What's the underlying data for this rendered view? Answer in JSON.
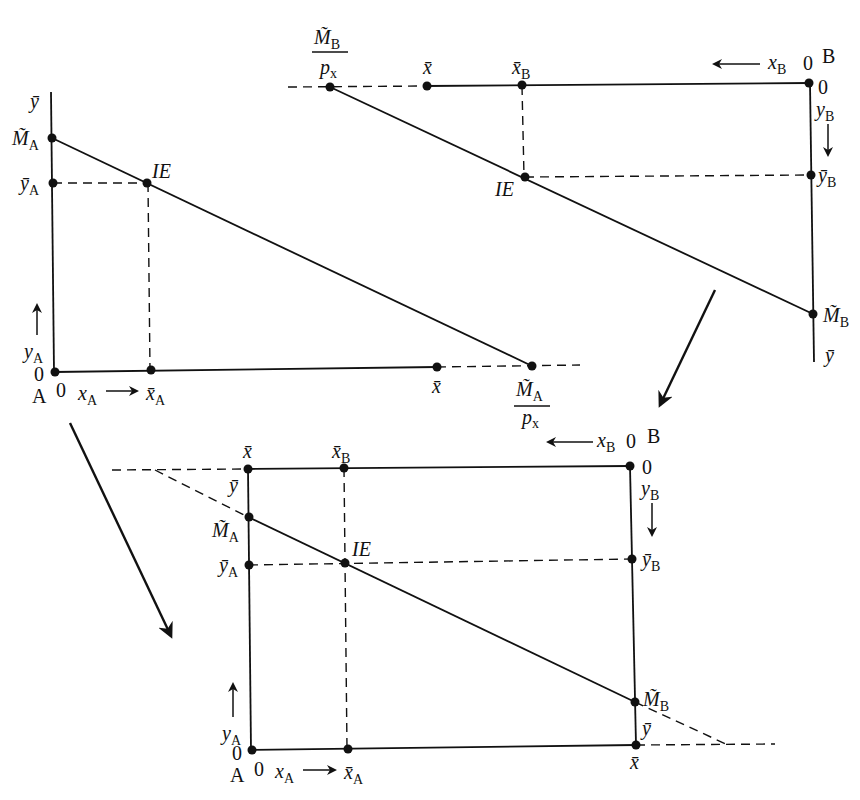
{
  "diagram": {
    "type": "edgeworth-box-construction",
    "panels": [
      {
        "id": "panel-A",
        "position": "top-left",
        "origin_label": "A",
        "origin_x_zero": "0",
        "origin_y_zero": "0",
        "x_axis_label": "x",
        "x_axis_sub": "A",
        "y_axis_label": "y",
        "y_axis_sub": "A",
        "y_top_label": "ȳ",
        "intercept_label": "M̃",
        "intercept_sub": "A",
        "endowment_y_label": "ȳ",
        "endowment_y_sub": "A",
        "endowment_x_label": "x̄",
        "endowment_x_sub": "A",
        "xbar_label": "x̄",
        "budget_x_intercept_num": "M̃",
        "budget_x_intercept_num_sub": "A",
        "budget_x_intercept_den": "p",
        "budget_x_intercept_den_sub": "x",
        "point_label": "IE"
      },
      {
        "id": "panel-B",
        "position": "top-right",
        "origin_label": "B",
        "origin_x_zero": "0",
        "origin_y_zero": "0",
        "x_axis_label": "x",
        "x_axis_sub": "B",
        "y_axis_label": "y",
        "y_axis_sub": "B",
        "y_bottom_label": "ȳ",
        "intercept_label": "M̃",
        "intercept_sub": "B",
        "endowment_y_label": "ȳ",
        "endowment_y_sub": "B",
        "endowment_x_label": "x̄",
        "endowment_x_sub": "B",
        "xbar_label": "x̄",
        "budget_x_intercept_num": "M̃",
        "budget_x_intercept_num_sub": "B",
        "budget_x_intercept_den": "p",
        "budget_x_intercept_den_sub": "x",
        "point_label": "IE"
      },
      {
        "id": "panel-box",
        "position": "bottom-center",
        "origin_A_label": "A",
        "origin_B_label": "B",
        "zero": "0",
        "xbar_label": "x̄",
        "ybar_label": "ȳ",
        "xA_label": "x",
        "xA_sub": "A",
        "yA_label": "y",
        "yA_sub": "A",
        "xB_label": "x",
        "xB_sub": "B",
        "yB_label": "y",
        "yB_sub": "B",
        "MA_label": "M̃",
        "MA_sub": "A",
        "MB_label": "M̃",
        "MB_sub": "B",
        "yAbar_label": "ȳ",
        "yAbar_sub": "A",
        "yBbar_label": "ȳ",
        "yBbar_sub": "B",
        "xAbar_label": "x̄",
        "xAbar_sub": "A",
        "xBbar_label": "x̄",
        "xBbar_sub": "B",
        "point_label": "IE"
      }
    ],
    "transition_arrows": [
      {
        "from": "panel-A",
        "to": "panel-box"
      },
      {
        "from": "panel-B",
        "to": "panel-box"
      }
    ]
  }
}
